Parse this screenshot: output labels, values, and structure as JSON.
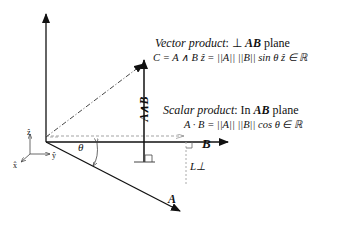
{
  "diagram": {
    "vector_product": {
      "title_italic": "Vector product",
      "title_rest": ": ⊥ ",
      "title_bold": "AB",
      "title_end": " plane",
      "equation": "C = A ∧ B ẑ = ||A|| ||B|| sin θ ẑ ∈ ℝ"
    },
    "scalar_product": {
      "title_italic": "Scalar product",
      "title_rest": ": In ",
      "title_bold": "AB",
      "title_end": " plane",
      "equation": "A · B = ||A|| ||B|| cos θ ∈ ℝ"
    },
    "labels": {
      "vector_A": "A",
      "vector_B": "B",
      "wedge": "A∧B",
      "theta": "θ",
      "L_perp": "L⊥",
      "axis_z": "ẑ",
      "axis_y": "ŷ",
      "axis_x": "x̂"
    },
    "colors": {
      "stroke": "#111111",
      "dashed": "#888888",
      "background": "#ffffff"
    }
  }
}
